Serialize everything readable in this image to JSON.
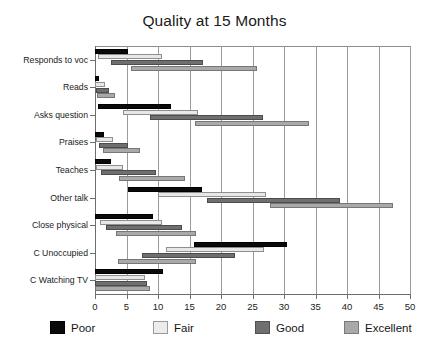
{
  "chart_data": {
    "type": "bar",
    "bar_style": "floating-range-horizontal",
    "orientation": "horizontal",
    "title": "Quality at 15 Months",
    "xlabel": "",
    "ylabel": "",
    "xlim": [
      0,
      50
    ],
    "xticks": [
      0,
      5,
      10,
      15,
      20,
      25,
      30,
      35,
      40,
      45,
      50
    ],
    "xtick_labels": [
      "0",
      "5",
      "10",
      "15",
      "20",
      "25",
      "30",
      "35",
      "40",
      "45",
      "50"
    ],
    "grid": "vertical",
    "legend_position": "bottom",
    "legend": [
      "Poor",
      "Fair",
      "Good",
      "Excellent"
    ],
    "series_colors": {
      "Poor": "#0a0a0a",
      "Fair": "#e8e8e8",
      "Good": "#6f6f6f",
      "Excellent": "#a9a9a9"
    },
    "categories": [
      "Responds to voc",
      "Reads",
      "Asks question",
      "Praises",
      "Teaches",
      "Other talk",
      "Close physical",
      "C Unoccupied",
      "C Watching TV"
    ],
    "series": [
      {
        "name": "Poor",
        "ranges": [
          [
            0.0,
            5.3
          ],
          [
            0.0,
            0.6
          ],
          [
            0.4,
            12.0
          ],
          [
            0.0,
            1.4
          ],
          [
            0.0,
            2.6
          ],
          [
            5.3,
            17.0
          ],
          [
            0.0,
            9.2
          ],
          [
            15.7,
            30.4
          ],
          [
            0.0,
            10.8
          ]
        ]
      },
      {
        "name": "Fair",
        "ranges": [
          [
            0.5,
            10.6
          ],
          [
            0.0,
            1.6
          ],
          [
            4.5,
            16.4
          ],
          [
            0.2,
            2.8
          ],
          [
            0.2,
            4.4
          ],
          [
            10.0,
            27.2
          ],
          [
            0.8,
            10.6
          ],
          [
            11.3,
            26.8
          ],
          [
            0.0,
            8.0
          ]
        ]
      },
      {
        "name": "Good",
        "ranges": [
          [
            2.5,
            17.2
          ],
          [
            0.2,
            2.2
          ],
          [
            8.7,
            26.7
          ],
          [
            0.6,
            5.2
          ],
          [
            1.0,
            9.7
          ],
          [
            17.8,
            38.9
          ],
          [
            1.8,
            13.8
          ],
          [
            7.4,
            22.2
          ],
          [
            0.0,
            8.2
          ]
        ]
      },
      {
        "name": "Excellent",
        "ranges": [
          [
            5.7,
            25.7
          ],
          [
            0.3,
            3.2
          ],
          [
            15.9,
            34.0
          ],
          [
            1.2,
            7.1
          ],
          [
            3.8,
            14.3
          ],
          [
            27.8,
            47.3
          ],
          [
            3.4,
            16.0
          ],
          [
            3.7,
            16.0
          ],
          [
            0.0,
            8.7
          ]
        ]
      }
    ]
  }
}
